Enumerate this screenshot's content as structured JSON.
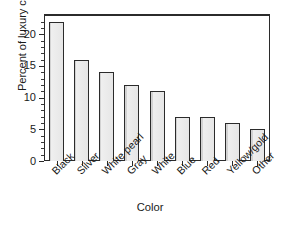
{
  "chart_data": {
    "type": "bar",
    "title": "",
    "subtitle": "",
    "xlabel": "Color",
    "ylabel": "Percent of luxury cars",
    "categories": [
      "Black",
      "Silver",
      "White pearl",
      "Gray",
      "White",
      "Blue",
      "Red",
      "Yellow/gold",
      "Other"
    ],
    "values": [
      22,
      16,
      14,
      12,
      11,
      7,
      7,
      6,
      5
    ],
    "ylim": [
      0,
      23.2
    ],
    "ytick_labels": [
      "0",
      "5",
      "10",
      "15",
      "20"
    ],
    "ytick_values": [
      0,
      5,
      10,
      15,
      20
    ],
    "yminor_step": 1,
    "grid": false,
    "legend": null,
    "annotations": [],
    "bar_fill_color": "#e9e9e9",
    "bar_edge_color": "#2b2b2b",
    "axis_color": "#2b2b2b",
    "background_color": "#ffffff",
    "xtick_label_rotation": -45
  }
}
